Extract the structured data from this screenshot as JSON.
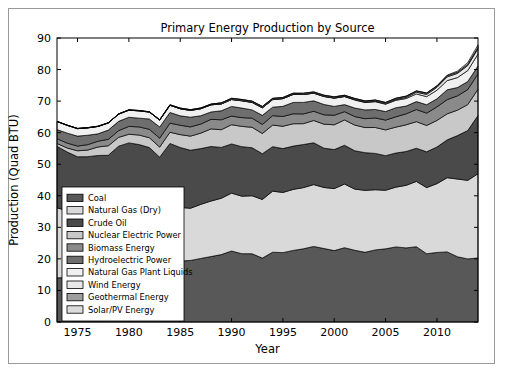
{
  "figure": {
    "outer_frame": true,
    "background": "#ffffff"
  },
  "chart_data": {
    "type": "area",
    "stacked": true,
    "title": "Primary Energy Production by Source",
    "xlabel": "Year",
    "ylabel": "Production (Quad BTU)",
    "xlim": [
      1973,
      2014
    ],
    "ylim": [
      0,
      90
    ],
    "xticks": [
      1975,
      1980,
      1985,
      1990,
      1995,
      2000,
      2005,
      2010
    ],
    "yticks": [
      0,
      10,
      20,
      30,
      40,
      50,
      60,
      70,
      80,
      90
    ],
    "grid": false,
    "legend_position": "lower left",
    "x": [
      1973,
      1974,
      1975,
      1976,
      1977,
      1978,
      1979,
      1980,
      1981,
      1982,
      1983,
      1984,
      1985,
      1986,
      1987,
      1988,
      1989,
      1990,
      1991,
      1992,
      1993,
      1994,
      1995,
      1996,
      1997,
      1998,
      1999,
      2000,
      2001,
      2002,
      2003,
      2004,
      2005,
      2006,
      2007,
      2008,
      2009,
      2010,
      2011,
      2012,
      2013,
      2014
    ],
    "series": [
      {
        "name": "Coal",
        "color": "#585858",
        "values": [
          13.99,
          14.07,
          14.99,
          15.65,
          15.76,
          14.91,
          17.54,
          18.6,
          18.38,
          18.64,
          17.25,
          19.72,
          19.33,
          19.51,
          20.14,
          20.74,
          21.36,
          22.49,
          21.64,
          21.63,
          20.25,
          22.11,
          21.98,
          22.68,
          23.2,
          23.94,
          23.29,
          22.62,
          23.55,
          22.73,
          22.09,
          22.85,
          23.19,
          23.79,
          23.49,
          23.85,
          21.63,
          22.04,
          22.22,
          20.68,
          20.0,
          20.29
        ]
      },
      {
        "name": "Natural Gas (Dry)",
        "color": "#d9d9d9",
        "values": [
          22.19,
          21.21,
          19.64,
          19.48,
          19.56,
          19.49,
          20.08,
          19.91,
          19.7,
          18.32,
          16.59,
          18.01,
          16.98,
          16.54,
          17.14,
          17.6,
          17.85,
          18.36,
          18.23,
          18.38,
          18.58,
          19.35,
          19.08,
          19.34,
          19.39,
          19.61,
          19.34,
          19.66,
          20.17,
          19.38,
          19.63,
          19.07,
          18.56,
          18.95,
          19.82,
          20.7,
          20.96,
          21.81,
          23.51,
          24.63,
          24.89,
          26.7
        ]
      },
      {
        "name": "Crude Oil",
        "color": "#4a4a4a",
        "values": [
          19.49,
          18.58,
          17.73,
          17.26,
          17.45,
          18.43,
          18.1,
          18.25,
          18.15,
          18.31,
          18.39,
          18.85,
          18.99,
          18.38,
          17.67,
          17.28,
          16.12,
          15.57,
          15.7,
          15.22,
          14.49,
          14.1,
          13.89,
          13.72,
          13.66,
          13.24,
          12.45,
          12.36,
          12.28,
          12.16,
          11.94,
          11.5,
          10.96,
          10.8,
          10.72,
          10.51,
          11.34,
          11.59,
          11.99,
          13.76,
          15.76,
          18.44
        ]
      },
      {
        "name": "Nuclear Electric Power",
        "color": "#c8c8c8",
        "values": [
          0.91,
          1.27,
          1.9,
          2.11,
          2.7,
          3.02,
          2.78,
          2.74,
          3.01,
          3.13,
          3.2,
          3.55,
          4.08,
          4.47,
          4.91,
          5.59,
          5.6,
          6.1,
          6.42,
          6.48,
          6.41,
          6.84,
          7.08,
          7.09,
          6.6,
          7.07,
          7.61,
          7.86,
          8.03,
          8.14,
          7.96,
          8.22,
          8.16,
          8.21,
          8.46,
          8.43,
          8.35,
          8.43,
          8.26,
          8.06,
          8.24,
          8.34
        ]
      },
      {
        "name": "Biomass Energy",
        "color": "#8a8a8a",
        "values": [
          1.53,
          1.54,
          1.5,
          1.71,
          1.84,
          2.04,
          2.15,
          2.48,
          2.59,
          2.66,
          2.83,
          2.88,
          2.98,
          2.93,
          2.87,
          3.02,
          3.16,
          2.74,
          2.78,
          2.89,
          2.86,
          2.99,
          3.1,
          3.16,
          3.1,
          2.93,
          2.97,
          3.01,
          2.62,
          2.7,
          2.81,
          3.02,
          3.12,
          3.28,
          3.49,
          3.85,
          3.9,
          4.31,
          4.5,
          4.54,
          4.75,
          4.89
        ]
      },
      {
        "name": "Hydroelectric Power",
        "color": "#6e6e6e",
        "values": [
          2.86,
          3.18,
          3.15,
          2.98,
          2.33,
          2.94,
          2.93,
          2.9,
          2.76,
          3.27,
          3.53,
          3.39,
          2.97,
          3.07,
          2.63,
          2.33,
          2.84,
          3.05,
          3.02,
          2.62,
          2.89,
          2.68,
          3.21,
          3.59,
          3.64,
          3.3,
          3.27,
          2.81,
          2.24,
          2.69,
          2.79,
          2.69,
          2.7,
          2.87,
          2.45,
          2.51,
          2.67,
          2.54,
          3.1,
          2.63,
          2.56,
          2.47
        ]
      },
      {
        "name": "Natural Gas Plant Liquids",
        "color": "#f0f0f0",
        "values": [
          2.57,
          2.47,
          2.37,
          2.33,
          2.33,
          2.25,
          2.29,
          2.25,
          2.31,
          2.19,
          2.18,
          2.27,
          2.24,
          2.15,
          2.22,
          2.26,
          2.16,
          2.18,
          2.31,
          2.36,
          2.4,
          2.39,
          2.44,
          2.53,
          2.5,
          2.42,
          2.52,
          2.61,
          2.55,
          2.56,
          2.35,
          2.47,
          2.33,
          2.36,
          2.4,
          2.42,
          2.57,
          2.73,
          2.93,
          3.15,
          3.47,
          3.78
        ]
      },
      {
        "name": "Wind Energy",
        "color": "#e8e8e8",
        "values": [
          0.0,
          0.0,
          0.0,
          0.0,
          0.0,
          0.0,
          0.0,
          0.0,
          0.0,
          0.0,
          0.0,
          0.0,
          0.01,
          0.01,
          0.01,
          0.01,
          0.02,
          0.03,
          0.03,
          0.03,
          0.03,
          0.04,
          0.03,
          0.03,
          0.03,
          0.03,
          0.05,
          0.06,
          0.07,
          0.11,
          0.12,
          0.14,
          0.18,
          0.26,
          0.34,
          0.55,
          0.72,
          0.92,
          1.17,
          1.34,
          1.6,
          1.73
        ]
      },
      {
        "name": "Geothermal Energy",
        "color": "#9e9e9e",
        "values": [
          0.04,
          0.05,
          0.07,
          0.08,
          0.08,
          0.06,
          0.08,
          0.11,
          0.12,
          0.1,
          0.13,
          0.16,
          0.2,
          0.22,
          0.23,
          0.22,
          0.32,
          0.34,
          0.35,
          0.35,
          0.36,
          0.34,
          0.29,
          0.32,
          0.33,
          0.33,
          0.33,
          0.32,
          0.31,
          0.33,
          0.33,
          0.34,
          0.34,
          0.34,
          0.35,
          0.36,
          0.37,
          0.38,
          0.39,
          0.4,
          0.41,
          0.42
        ]
      },
      {
        "name": "Solar/PV Energy",
        "color": "#dcdcdc",
        "values": [
          0.0,
          0.0,
          0.0,
          0.0,
          0.0,
          0.0,
          0.0,
          0.0,
          0.0,
          0.0,
          0.0,
          0.0,
          0.0,
          0.0,
          0.0,
          0.0,
          0.0,
          0.06,
          0.06,
          0.06,
          0.06,
          0.07,
          0.07,
          0.07,
          0.07,
          0.07,
          0.07,
          0.07,
          0.07,
          0.06,
          0.06,
          0.06,
          0.06,
          0.07,
          0.08,
          0.09,
          0.1,
          0.13,
          0.19,
          0.32,
          0.53,
          0.77
        ]
      }
    ]
  }
}
